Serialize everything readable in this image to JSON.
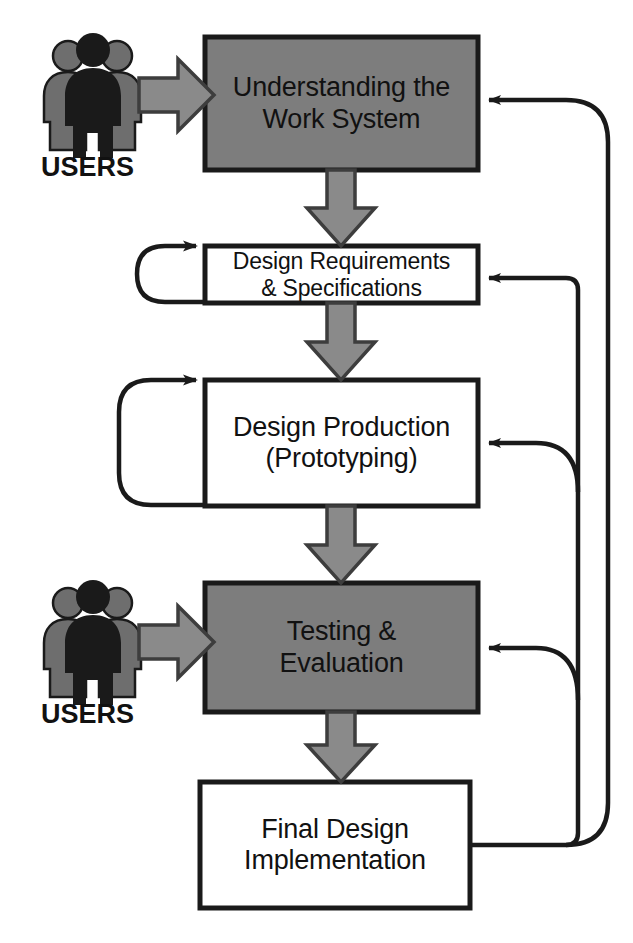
{
  "diagram": {
    "type": "flowchart",
    "colors": {
      "highlight_fill": "#7d7d7d",
      "plain_fill": "#ffffff",
      "stroke": "#1a1a1a",
      "arrow_fill": "#8a8a8a",
      "users_dark": "#1a1a1a",
      "users_gray": "#6e6e6e",
      "background": "#ffffff"
    },
    "nodes": [
      {
        "id": "understanding",
        "label": "Understanding the\nWork System",
        "fill": "highlight",
        "self_loop": false
      },
      {
        "id": "requirements",
        "label": "Design Requirements\n& Specifications",
        "fill": "plain",
        "self_loop": true
      },
      {
        "id": "production",
        "label": "Design Production\n(Prototyping)",
        "fill": "plain",
        "self_loop": true
      },
      {
        "id": "testing",
        "label": "Testing &\nEvaluation",
        "fill": "highlight",
        "self_loop": false
      },
      {
        "id": "final",
        "label": "Final Design\nImplementation",
        "fill": "plain",
        "self_loop": false
      }
    ],
    "actors": [
      {
        "id": "users-top",
        "label": "USERS",
        "target": "understanding"
      },
      {
        "id": "users-bottom",
        "label": "USERS",
        "target": "testing"
      }
    ],
    "flow_edges": [
      {
        "from": "understanding",
        "to": "requirements",
        "style": "block-arrow-down"
      },
      {
        "from": "requirements",
        "to": "production",
        "style": "block-arrow-down"
      },
      {
        "from": "production",
        "to": "testing",
        "style": "block-arrow-down"
      },
      {
        "from": "testing",
        "to": "final",
        "style": "block-arrow-down"
      }
    ],
    "feedback_edges": [
      {
        "from": "final",
        "to": "understanding",
        "style": "outer-loop-line"
      },
      {
        "from": "final",
        "to": "requirements",
        "style": "inner-loop-line"
      },
      {
        "from": "final",
        "to": "production",
        "style": "inner-loop-line"
      },
      {
        "from": "final",
        "to": "testing",
        "style": "inner-loop-line"
      }
    ],
    "iteration_loops": [
      {
        "node": "requirements",
        "style": "self-loop-left"
      },
      {
        "node": "production",
        "style": "self-loop-left"
      }
    ]
  }
}
